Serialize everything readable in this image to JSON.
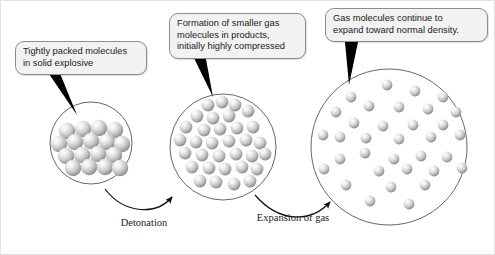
{
  "figure": {
    "background_color": "#ffffff",
    "frame_color": "#e3e3e3",
    "width": 495,
    "height": 255
  },
  "callouts": [
    {
      "id": "callout-1",
      "text": "Tightly packed molecules\nin solid explosive",
      "fill_color": "#f2f2f2",
      "border_color": "#8d8d8d",
      "points_to": "stage-1-circle"
    },
    {
      "id": "callout-2",
      "text": "Formation of smaller gas\nmolecules in products,\ninitially highly compressed",
      "fill_color": "#f2f2f2",
      "border_color": "#8d8d8d",
      "points_to": "stage-2-circle"
    },
    {
      "id": "callout-3",
      "text": "Gas molecules continue to\nexpand toward normal density.",
      "fill_color": "#f2f2f2",
      "border_color": "#8d8d8d",
      "points_to": "stage-3-circle"
    }
  ],
  "arrow_labels": [
    {
      "id": "label-detonation",
      "text": "Detonation"
    },
    {
      "id": "label-expansion",
      "text": "Expansion\nof gas"
    }
  ],
  "stages": [
    {
      "id": "stage-1",
      "name": "solid-explosive",
      "circle": {
        "cx": 90,
        "cy": 142,
        "r": 41
      },
      "molecule_radius": 8.2,
      "molecule_count": 17,
      "description": "Tightly packed lattice of molecules"
    },
    {
      "id": "stage-2",
      "name": "compressed-gas-products",
      "circle": {
        "cx": 222,
        "cy": 146,
        "r": 53
      },
      "molecule_radius": 6.4,
      "molecule_count": 33,
      "description": "Smaller gas molecules, highly compressed"
    },
    {
      "id": "stage-3",
      "name": "expanding-gas",
      "circle": {
        "cx": 388,
        "cy": 146,
        "r": 78
      },
      "molecule_radius": 5.4,
      "molecule_count": 34,
      "description": "Gas molecules expanding toward normal density"
    }
  ],
  "colors": {
    "sphere_highlight": "#ffffff",
    "sphere_mid": "#c9c9c9",
    "sphere_edge": "#6e6e6e",
    "circle_outline": "#555555",
    "arrow": "#111111",
    "pointer_tail": "#000000"
  }
}
